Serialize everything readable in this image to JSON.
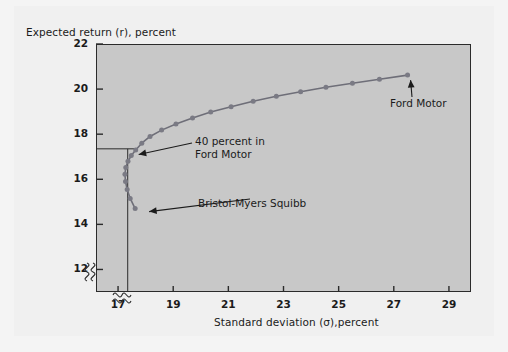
{
  "figure": {
    "background_color": "#f0f0f0",
    "plot_background_color": "#c8c8c8",
    "axis_color": "#2b2b2b",
    "curve_color": "#6e6e78",
    "marker_color": "#7a7a84"
  },
  "chart_data": {
    "type": "line",
    "title": "",
    "xlabel": "Standard deviation (σ),percent",
    "ylabel": "Expected return (r), percent",
    "xlim": [
      16.2,
      29.8
    ],
    "ylim": [
      11.0,
      22.0
    ],
    "xticks": [
      17,
      19,
      21,
      23,
      25,
      27,
      29
    ],
    "xtick_labels": [
      "17",
      "19",
      "21",
      "23",
      "25",
      "27",
      "29"
    ],
    "yticks": [
      12,
      14,
      16,
      18,
      20,
      22
    ],
    "ytick_labels": [
      "12",
      "14",
      "16",
      "18",
      "20",
      "22"
    ],
    "grid": false,
    "legend": "none",
    "axis_breaks": {
      "x_break": true,
      "y_break": true,
      "note": "squiggle break marks near origin on both axes"
    },
    "series": [
      {
        "name": "Portfolio frontier (Bristol-Myers Squibb / Ford Motor mixes)",
        "x": [
          17.62,
          17.44,
          17.33,
          17.27,
          17.25,
          17.28,
          17.36,
          17.48,
          17.64,
          17.86,
          18.16,
          18.58,
          19.1,
          19.7,
          20.36,
          21.1,
          21.9,
          22.74,
          23.62,
          24.54,
          25.5,
          26.48,
          27.5
        ],
        "y": [
          14.7,
          15.15,
          15.55,
          15.9,
          16.22,
          16.52,
          16.8,
          17.05,
          17.3,
          17.6,
          17.9,
          18.18,
          18.45,
          18.72,
          18.98,
          19.22,
          19.46,
          19.68,
          19.88,
          20.08,
          20.26,
          20.44,
          20.62
        ],
        "marker": "circle"
      }
    ],
    "reference_lines": [
      {
        "type": "horizontal",
        "y": 17.35,
        "from_x": 16.2,
        "to_x": 17.64
      },
      {
        "type": "vertical",
        "x": 17.35,
        "from_y": 11.0,
        "to_y": 17.35
      }
    ],
    "annotations": [
      {
        "id": "forty-percent-ford",
        "text_lines": [
          "40 percent in",
          "Ford Motor"
        ],
        "points_to": {
          "x": 17.64,
          "y": 17.32
        }
      },
      {
        "id": "bristol-myers-squibb",
        "text_lines": [
          "Bristol-Myers Squibb"
        ],
        "points_to": {
          "x": 17.62,
          "y": 14.7
        }
      },
      {
        "id": "ford-motor",
        "text_lines": [
          "Ford Motor"
        ],
        "points_to": {
          "x": 27.5,
          "y": 20.62
        }
      }
    ]
  }
}
